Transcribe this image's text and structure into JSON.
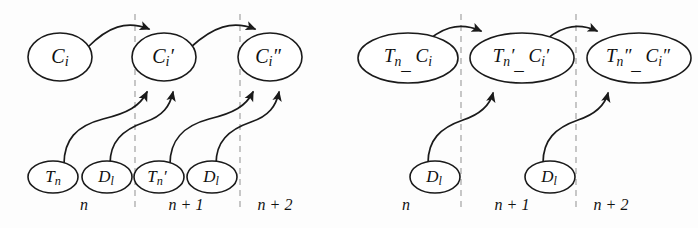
{
  "figure": {
    "background_color": "#fdfdfd",
    "stroke_color": "#1a1a1a",
    "divider_color": "#b9b9b9"
  },
  "panels": [
    {
      "id": "left-panel",
      "name": "separate-context-panel",
      "time_labels": [
        "n",
        "n + 1",
        "n + 2"
      ],
      "top_nodes": [
        {
          "id": "c-i",
          "base": "C",
          "sub": "i",
          "prime": "",
          "text": "C i"
        },
        {
          "id": "c-i-prime",
          "base": "C",
          "sub": "i",
          "prime": "′",
          "text": "C i′"
        },
        {
          "id": "c-i-dprime",
          "base": "C",
          "sub": "i",
          "prime": "″",
          "text": "C i″"
        }
      ],
      "bottom_nodes": [
        {
          "id": "t-n",
          "base": "T",
          "sub": "n",
          "prime": "",
          "text": "T n"
        },
        {
          "id": "d-l-1",
          "base": "D",
          "sub": "l",
          "prime": "",
          "text": "D l"
        },
        {
          "id": "t-n-prime",
          "base": "T",
          "sub": "n",
          "prime": "′",
          "text": "T n′"
        },
        {
          "id": "d-l-2",
          "base": "D",
          "sub": "l",
          "prime": "",
          "text": "D l"
        }
      ],
      "edges": [
        {
          "from": "c-i",
          "to": "c-i-prime",
          "kind": "temporal"
        },
        {
          "from": "c-i-prime",
          "to": "c-i-dprime",
          "kind": "temporal"
        },
        {
          "from": "t-n",
          "to": "c-i-prime",
          "kind": "evidence"
        },
        {
          "from": "d-l-1",
          "to": "c-i-prime",
          "kind": "evidence"
        },
        {
          "from": "t-n-prime",
          "to": "c-i-dprime",
          "kind": "evidence"
        },
        {
          "from": "d-l-2",
          "to": "c-i-dprime",
          "kind": "evidence"
        }
      ]
    },
    {
      "id": "right-panel",
      "name": "merged-context-panel",
      "time_labels": [
        "n",
        "n + 1",
        "n + 2"
      ],
      "top_nodes": [
        {
          "id": "tc-1",
          "text": "T n _ C i",
          "part1_base": "T",
          "part1_sub": "n",
          "part1_prime": "",
          "part2_base": "C",
          "part2_sub": "i",
          "part2_prime": ""
        },
        {
          "id": "tc-2",
          "text": "T n′ _ C i′",
          "part1_base": "T",
          "part1_sub": "n",
          "part1_prime": "′",
          "part2_base": "C",
          "part2_sub": "i",
          "part2_prime": "′"
        },
        {
          "id": "tc-3",
          "text": "T n″ _ C i″",
          "part1_base": "T",
          "part1_sub": "n",
          "part1_prime": "″",
          "part2_base": "C",
          "part2_sub": "i",
          "part2_prime": "″"
        }
      ],
      "bottom_nodes": [
        {
          "id": "d-l-3",
          "base": "D",
          "sub": "l",
          "prime": "",
          "text": "D l"
        },
        {
          "id": "d-l-4",
          "base": "D",
          "sub": "l",
          "prime": "",
          "text": "D l"
        }
      ],
      "edges": [
        {
          "from": "tc-1",
          "to": "tc-2",
          "kind": "temporal"
        },
        {
          "from": "tc-2",
          "to": "tc-3",
          "kind": "temporal"
        },
        {
          "from": "d-l-3",
          "to": "tc-2",
          "kind": "evidence"
        },
        {
          "from": "d-l-4",
          "to": "tc-3",
          "kind": "evidence"
        }
      ]
    }
  ]
}
